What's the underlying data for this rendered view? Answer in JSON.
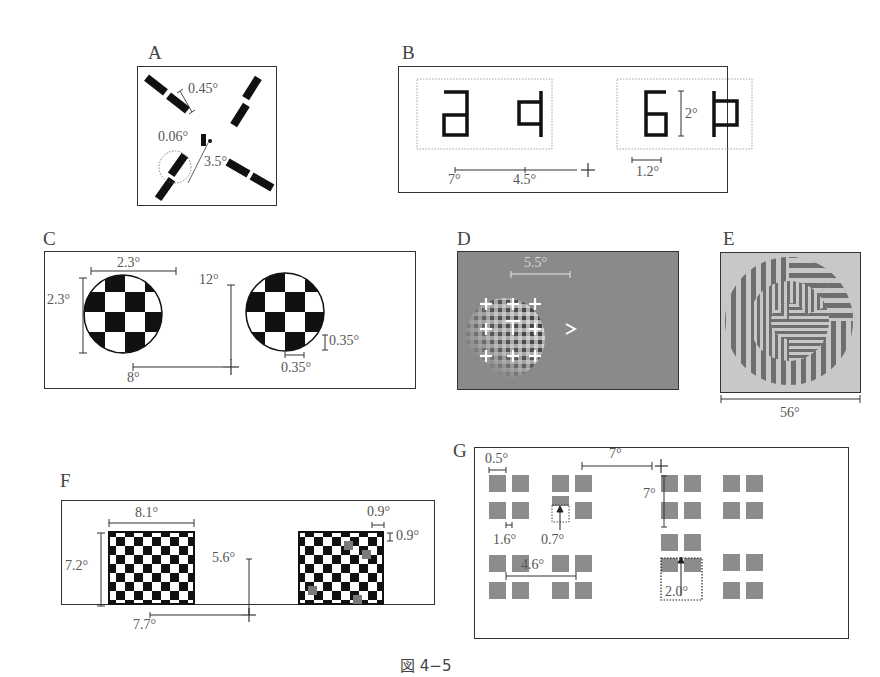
{
  "figure": {
    "caption": "図 4−5",
    "panels": {
      "A": {
        "label": "A",
        "dims": [
          "0.45°",
          "0.06°",
          "3.5°"
        ],
        "description": "Four radial arms of dashed bars around fixation dot; dotted circle marks a target bar"
      },
      "B": {
        "label": "B",
        "dims": [
          "7°",
          "4.5°",
          "2°",
          "1.2°"
        ],
        "glyph_groups": [
          [
            "rotated-a",
            "rotated-b"
          ],
          [
            "rotated-6",
            "rotated-p"
          ]
        ],
        "fixation": "+"
      },
      "C": {
        "label": "C",
        "dims": [
          "2.3°",
          "2.3°",
          "12°",
          "8°",
          "0.35°",
          "0.35°"
        ],
        "description": "Two circular checkerboard patches with fixation cross"
      },
      "D": {
        "label": "D",
        "dims": [
          "5.5°"
        ],
        "description": "Gabor-like plaid patch with 3x3 crosses, central T, and > marker on gray field"
      },
      "E": {
        "label": "E",
        "dims": [
          "56°"
        ],
        "description": "Concentric grating segments of vertical and horizontal stripes"
      },
      "F": {
        "label": "F",
        "dims": [
          "8.1°",
          "7.2°",
          "5.6°",
          "7.7°",
          "0.9°",
          "0.9°"
        ],
        "description": "Two rectangular checkerboards; right one contains gray target squares"
      },
      "G": {
        "label": "G",
        "dims": [
          "7°",
          "7°",
          "0.5°",
          "1.6°",
          "0.7°",
          "4.6°",
          "2.0°"
        ],
        "description": "Arrays of gray squares in 2x2 clusters with displaced squares marked by dotted outlines and arrows"
      }
    }
  }
}
